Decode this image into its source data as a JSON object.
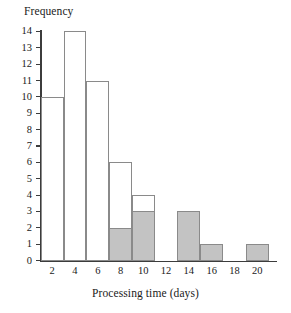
{
  "chart_data": {
    "type": "bar",
    "title": "",
    "xlabel": "Processing time (days)",
    "ylabel": "Frequency",
    "xlim": [
      0,
      21.5
    ],
    "ylim": [
      0,
      14.5
    ],
    "grid": false,
    "legend": "none",
    "bin_width": 2,
    "x_tick_labels": [
      "2",
      "4",
      "6",
      "8",
      "10",
      "12",
      "14",
      "16",
      "18",
      "20"
    ],
    "x_tick_values": [
      2,
      4,
      6,
      8,
      10,
      12,
      14,
      16,
      18,
      20
    ],
    "y_tick_labels": [
      "0",
      "1",
      "2",
      "3",
      "4",
      "5",
      "6",
      "7",
      "8",
      "9",
      "10",
      "11",
      "12",
      "13",
      "14"
    ],
    "y_tick_values": [
      0,
      1,
      2,
      3,
      4,
      5,
      6,
      7,
      8,
      9,
      10,
      11,
      12,
      13,
      14
    ],
    "colors": {
      "shaded": "#c3c3c3",
      "unshaded": "#ffffff",
      "outline": "#8a8a8a",
      "axis": "#3c3c3c",
      "text": "#1a1a1a"
    },
    "series": [
      {
        "name": "Total frequency",
        "values": [
          10,
          14,
          11,
          6,
          4,
          0,
          3,
          1,
          0,
          1
        ]
      },
      {
        "name": "Shaded frequency",
        "values": [
          0,
          0,
          0,
          2,
          3,
          0,
          3,
          1,
          0,
          1
        ]
      }
    ],
    "bins": [
      {
        "label": "1-3",
        "start": 1,
        "end": 3,
        "total": 10,
        "shaded": 0
      },
      {
        "label": "3-5",
        "start": 3,
        "end": 5,
        "total": 14,
        "shaded": 0
      },
      {
        "label": "5-7",
        "start": 5,
        "end": 7,
        "total": 11,
        "shaded": 0
      },
      {
        "label": "7-9",
        "start": 7,
        "end": 9,
        "total": 6,
        "shaded": 2
      },
      {
        "label": "9-11",
        "start": 9,
        "end": 11,
        "total": 4,
        "shaded": 3
      },
      {
        "label": "11-13",
        "start": 11,
        "end": 13,
        "total": 0,
        "shaded": 0
      },
      {
        "label": "13-15",
        "start": 13,
        "end": 15,
        "total": 3,
        "shaded": 3
      },
      {
        "label": "15-17",
        "start": 15,
        "end": 17,
        "total": 1,
        "shaded": 1
      },
      {
        "label": "17-19",
        "start": 17,
        "end": 19,
        "total": 0,
        "shaded": 0
      },
      {
        "label": "19-21",
        "start": 19,
        "end": 21,
        "total": 1,
        "shaded": 1
      }
    ]
  }
}
